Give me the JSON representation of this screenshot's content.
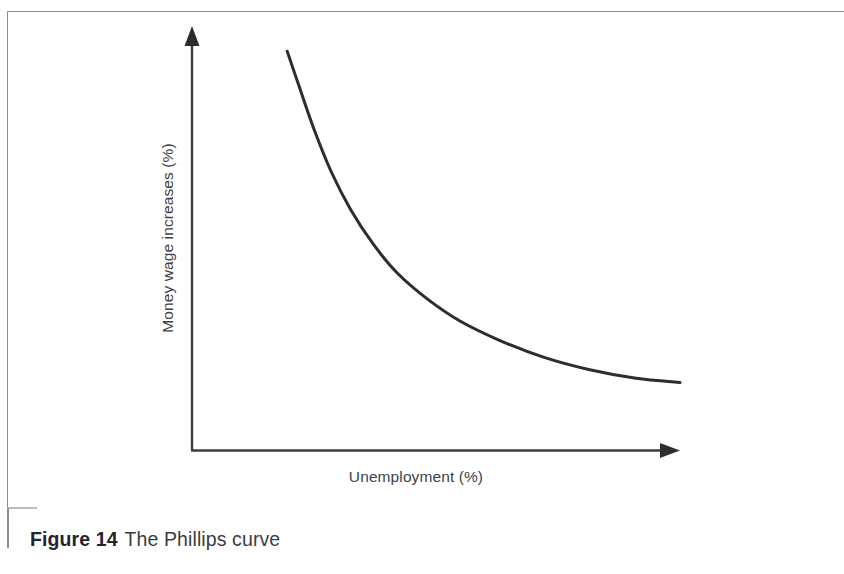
{
  "figure": {
    "caption_number": "Figure 14",
    "caption_text": "The Phillips curve",
    "frame_border_color": "#8a8d90",
    "background_color": "#ffffff"
  },
  "axes": {
    "y_title": "Money wage increases (%)",
    "x_title": "Unemployment (%)",
    "axis_color": "#3a3d40",
    "arrow_heads": {
      "y_axis": "arrow-up-icon",
      "x_axis": "arrow-right-icon"
    }
  },
  "chart_data": {
    "type": "line",
    "title": "The Phillips curve",
    "xlabel": "Unemployment (%)",
    "ylabel": "Money wage increases (%)",
    "grid": false,
    "legend": "none",
    "xlim": [
      0,
      10
    ],
    "ylim": [
      0,
      10
    ],
    "axis_ticks": {
      "x": [],
      "y": []
    },
    "series": [
      {
        "name": "Phillips curve",
        "color": "#2b2e30",
        "line_width": 3,
        "shape": "convex-decreasing-hyperbola",
        "x": [
          1.95,
          2.2,
          2.5,
          2.85,
          3.25,
          3.7,
          4.2,
          4.8,
          5.5,
          6.3,
          7.2,
          8.15,
          9.1,
          10.0
        ],
        "y": [
          9.45,
          8.6,
          7.6,
          6.6,
          5.7,
          4.9,
          4.2,
          3.6,
          3.05,
          2.6,
          2.2,
          1.9,
          1.7,
          1.6
        ]
      }
    ],
    "annotations": []
  }
}
